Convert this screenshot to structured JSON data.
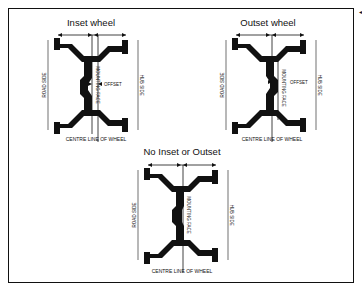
{
  "diagrams": {
    "inset": {
      "title": "Inset wheel",
      "road_side": "ROAD SIDE",
      "hub_side": "HUB SIDE",
      "mounting_face": "MOUNTING FACE",
      "offset": "OFFSET",
      "centre_line": "CENTRE LINE OF WHEEL"
    },
    "outset": {
      "title": "Outset wheel",
      "road_side": "ROAD SIDE",
      "hub_side": "HUB SIDE",
      "mounting_face": "MOUNTING FACE",
      "offset": "OFFSET",
      "centre_line": "CENTRE LINE OF WHEEL"
    },
    "none": {
      "title": "No Inset or Outset",
      "road_side": "ROAD SIDE",
      "hub_side": "HUB SIDE",
      "mounting_face": "MOUNTING FACE",
      "centre_line": "CENTRE LINE OF WHEEL"
    }
  },
  "colors": {
    "ink": "#111111",
    "background": "#ffffff"
  }
}
